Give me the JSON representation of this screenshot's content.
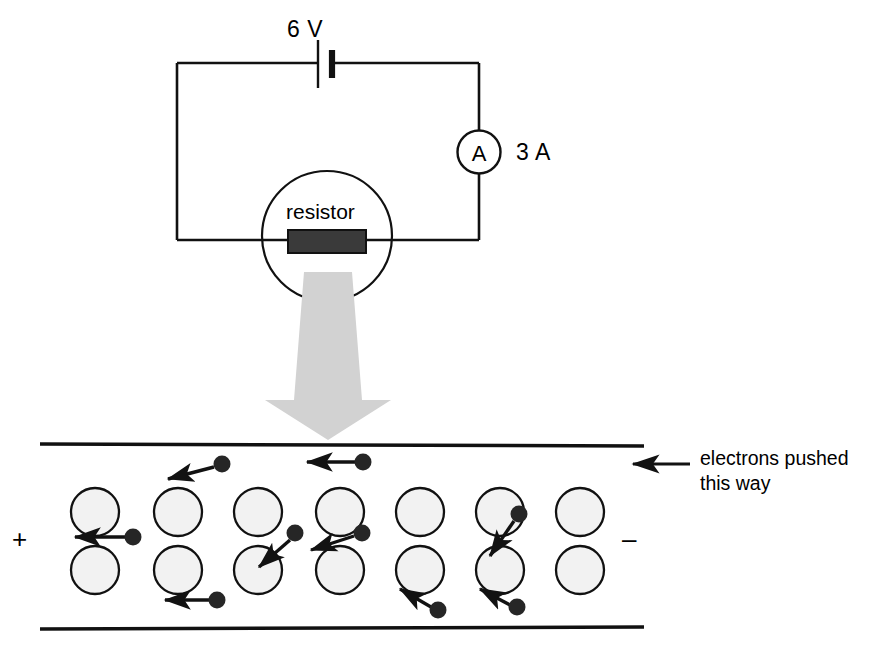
{
  "figure": {
    "colors": {
      "stroke": "#000000",
      "background": "#ffffff",
      "resistor_fill": "#3a3a3a",
      "ion_fill": "#f2f2f2",
      "electron_fill": "#262626",
      "big_arrow_fill": "#d2d2d2"
    }
  },
  "circuit": {
    "battery": {
      "label": "6 V",
      "icon": "battery-cell-icon"
    },
    "ammeter": {
      "symbol": "A",
      "reading": "3 A",
      "icon": "ammeter-icon"
    },
    "resistor": {
      "label": "resistor",
      "icon": "resistor-icon"
    },
    "zoom_arrow": {
      "icon": "magnify-down-arrow-icon",
      "direction": "down"
    }
  },
  "conductor": {
    "terminals": {
      "left_sign": "+",
      "right_sign": "–"
    },
    "annotation": {
      "text": "electrons pushed\nthis way",
      "line1": "electrons pushed",
      "line2": "this way",
      "arrow_icon": "left-arrow-icon",
      "arrow_direction": "left"
    },
    "lattice": {
      "rows": 2,
      "columns": 7,
      "ion_label": "positive-ion",
      "row_y": [
        512,
        570
      ],
      "column_x": [
        95,
        178,
        258,
        340,
        420,
        500,
        580
      ]
    },
    "electrons": [
      {
        "x": 222,
        "y": 464,
        "arrow": "left"
      },
      {
        "x": 363,
        "y": 462,
        "arrow": "left"
      },
      {
        "x": 133,
        "y": 537,
        "arrow": "left"
      },
      {
        "x": 295,
        "y": 533,
        "arrow": "down-left"
      },
      {
        "x": 362,
        "y": 533,
        "arrow": "left-down"
      },
      {
        "x": 519,
        "y": 514,
        "arrow": "down-left"
      },
      {
        "x": 217,
        "y": 600,
        "arrow": "left"
      },
      {
        "x": 438,
        "y": 610,
        "arrow": "up-left"
      },
      {
        "x": 517,
        "y": 607,
        "arrow": "up-left"
      }
    ]
  }
}
